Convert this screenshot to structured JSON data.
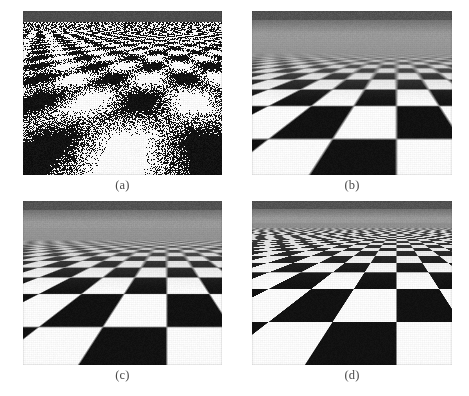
{
  "figure": {
    "background_color": "#ffffff",
    "width": 469,
    "height": 396,
    "caption_color": "#4a4a4a",
    "columns": 2,
    "rows": 2
  },
  "panels": [
    {
      "id": "a",
      "caption": "(a)",
      "label": "point-sampled-aliased",
      "description": "Point sampling with no filtering: severe aliasing and moire noise near the horizon",
      "filter_mode": "point sampling (no filtering)",
      "x": 23,
      "y": 11,
      "width": 199,
      "height": 164,
      "caption_y": 178,
      "sky": {
        "dark_band_color": "#4f4f4f",
        "dark_band_height": 11,
        "haze_color": "#ffffff",
        "haze_height": 0
      },
      "floor": {
        "horizon_y": 11,
        "tile_color_light": "#ffffff",
        "tile_color_dark": "#121212",
        "vanishing_x_ratio": 0.72,
        "tiles_across": 9,
        "filter_blur": 0.0,
        "aliasing": 1.0,
        "haze_strength": 0.0,
        "anisotropy": 0.0,
        "noise": 0.3
      }
    },
    {
      "id": "b",
      "caption": "(b)",
      "label": "mipmap-trilinear-overblurred",
      "description": "Mip-mapped trilinear filtering: aliasing removed but distance is over-blurred to uniform gray",
      "filter_mode": "mip-map / trilinear",
      "x": 252,
      "y": 11,
      "width": 200,
      "height": 164,
      "caption_y": 178,
      "sky": {
        "dark_band_color": "#555555",
        "dark_band_height": 9,
        "haze_color": "#9c9c9c",
        "haze_height": 20
      },
      "floor": {
        "horizon_y": 29,
        "tile_color_light": "#ffffff",
        "tile_color_dark": "#121212",
        "vanishing_x_ratio": 0.72,
        "tiles_across": 9,
        "filter_blur": 1.0,
        "aliasing": 0.0,
        "haze_strength": 1.0,
        "anisotropy": 0.0,
        "noise": 0.16
      }
    },
    {
      "id": "c",
      "caption": "(c)",
      "label": "mipmap-improved",
      "description": "Improved mip-map filtering: slightly sharper than (b) but still blurred toward the horizon",
      "filter_mode": "mip-map with better level selection",
      "x": 23,
      "y": 201,
      "width": 199,
      "height": 164,
      "caption_y": 368,
      "sky": {
        "dark_band_color": "#555555",
        "dark_band_height": 9,
        "haze_color": "#9c9c9c",
        "haze_height": 18
      },
      "floor": {
        "horizon_y": 27,
        "tile_color_light": "#ffffff",
        "tile_color_dark": "#121212",
        "vanishing_x_ratio": 0.72,
        "tiles_across": 9,
        "filter_blur": 0.82,
        "aliasing": 0.0,
        "haze_strength": 0.82,
        "anisotropy": 0.18,
        "noise": 0.16
      }
    },
    {
      "id": "d",
      "caption": "(d)",
      "label": "anisotropic-filtering",
      "description": "Anisotropic / EWA filtering: sharp detail retained all the way to the vanishing point",
      "filter_mode": "anisotropic (EWA) filtering",
      "x": 252,
      "y": 201,
      "width": 200,
      "height": 164,
      "caption_y": 368,
      "sky": {
        "dark_band_color": "#555555",
        "dark_band_height": 8,
        "haze_color": "#9c9c9c",
        "haze_height": 14
      },
      "floor": {
        "horizon_y": 22,
        "tile_color_light": "#ffffff",
        "tile_color_dark": "#121212",
        "vanishing_x_ratio": 0.72,
        "tiles_across": 9,
        "filter_blur": 0.22,
        "aliasing": 0.0,
        "haze_strength": 0.45,
        "anisotropy": 1.0,
        "noise": 0.14
      }
    }
  ]
}
